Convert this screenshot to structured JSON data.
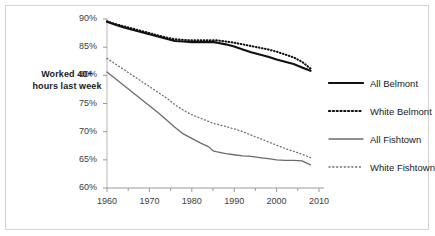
{
  "chart_data": {
    "type": "line",
    "title": "",
    "subtitle": "",
    "xlabel": "",
    "ylabel": "Worked 40+ hours last week",
    "xlim": [
      1960,
      2010
    ],
    "ylim": [
      60,
      90
    ],
    "grid": false,
    "legend_position": "right",
    "ytick_labels": [
      "90%",
      "85%",
      "80%",
      "75%",
      "70%",
      "65%",
      "60%"
    ],
    "ytick_values": [
      90,
      85,
      80,
      75,
      70,
      65,
      60
    ],
    "xtick_labels": [
      "1960",
      "1970",
      "1980",
      "1990",
      "2000",
      "2010"
    ],
    "xtick_values": [
      1960,
      1970,
      1980,
      1990,
      2000,
      2010
    ],
    "minor_xtick_interval": 5,
    "x": [
      1960,
      1962,
      1964,
      1966,
      1968,
      1970,
      1972,
      1974,
      1976,
      1978,
      1980,
      1982,
      1984,
      1985,
      1986,
      1988,
      1990,
      1992,
      1994,
      1996,
      1998,
      2000,
      2002,
      2004,
      2006,
      2008
    ],
    "series": [
      {
        "name": "All Belmont",
        "style": "solid",
        "color": "#111111",
        "width": 2.1,
        "values": [
          89.5,
          89.0,
          88.5,
          88.1,
          87.7,
          87.3,
          86.9,
          86.5,
          86.1,
          86.0,
          85.9,
          85.9,
          85.9,
          85.9,
          85.8,
          85.5,
          85.1,
          84.6,
          84.1,
          83.7,
          83.3,
          82.8,
          82.4,
          82.0,
          81.4,
          80.8
        ]
      },
      {
        "name": "White Belmont",
        "style": "dotted",
        "color": "#111111",
        "width": 2.1,
        "values": [
          89.6,
          89.1,
          88.7,
          88.3,
          87.9,
          87.5,
          87.1,
          86.7,
          86.4,
          86.3,
          86.2,
          86.2,
          86.2,
          86.2,
          86.2,
          86.0,
          85.8,
          85.5,
          85.2,
          84.9,
          84.6,
          84.2,
          83.7,
          83.2,
          82.4,
          81.2
        ]
      },
      {
        "name": "All Fishtown",
        "style": "solid",
        "color": "#6b6b6b",
        "width": 1.3,
        "values": [
          80.6,
          79.4,
          78.2,
          77.0,
          75.8,
          74.6,
          73.4,
          72.1,
          70.8,
          69.6,
          68.8,
          68.0,
          67.3,
          66.6,
          66.4,
          66.1,
          65.9,
          65.7,
          65.6,
          65.4,
          65.2,
          65.0,
          64.9,
          64.9,
          64.8,
          64.1
        ]
      },
      {
        "name": "White Fishtown",
        "style": "dotted",
        "color": "#6b6b6b",
        "width": 1.3,
        "values": [
          83.0,
          82.0,
          81.0,
          80.0,
          79.0,
          78.0,
          77.0,
          76.0,
          74.8,
          73.8,
          73.0,
          72.4,
          71.8,
          71.5,
          71.3,
          70.9,
          70.5,
          70.0,
          69.4,
          68.8,
          68.2,
          67.6,
          67.0,
          66.5,
          66.0,
          65.4
        ]
      }
    ]
  },
  "legend": {
    "items": [
      {
        "label": "All Belmont"
      },
      {
        "label": "White Belmont"
      },
      {
        "label": "All Fishtown"
      },
      {
        "label": "White Fishtown"
      }
    ]
  }
}
